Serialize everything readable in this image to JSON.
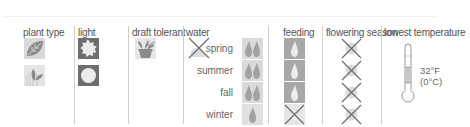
{
  "headers": {
    "plant_type": "plant type",
    "light": "light",
    "draft_tolerant": "draft tolerant",
    "water": "water",
    "feeding": "feeding",
    "flowering_season": "flowering season",
    "lowest_temperature": "lowest temperature"
  },
  "plant_type": {
    "icons": [
      "leaf-icon",
      "foliage-sprout-icon"
    ]
  },
  "light": {
    "icons": [
      "bright-sun-icon",
      "medium-sun-icon"
    ]
  },
  "draft_tolerant": {
    "icons": [
      "potted-plant-icon"
    ]
  },
  "water": {
    "header_icon": "crossed-out-mist-icon",
    "seasons": [
      {
        "label": "spring",
        "drops": 2
      },
      {
        "label": "summer",
        "drops": 2
      },
      {
        "label": "fall",
        "drops": 2
      },
      {
        "label": "winter",
        "drops": 1
      }
    ]
  },
  "feeding": {
    "seasons": [
      {
        "season": "spring",
        "value": "drop-icon"
      },
      {
        "season": "summer",
        "value": "drop-icon"
      },
      {
        "season": "fall",
        "value": "drop-icon"
      },
      {
        "season": "winter",
        "value": "none-x-icon"
      }
    ]
  },
  "flowering_season": {
    "seasons": [
      {
        "season": "spring",
        "value": "none-x-icon"
      },
      {
        "season": "summer",
        "value": "none-x-icon"
      },
      {
        "season": "fall",
        "value": "none-x-icon"
      },
      {
        "season": "winter",
        "value": "none-x-icon"
      }
    ]
  },
  "lowest_temperature": {
    "fahrenheit": "32°F",
    "celsius": "(0°C)"
  },
  "colors": {
    "icon_bg": "#d9d9d9",
    "icon_dark": "#6e6e6e",
    "drop": "#9a9a9a",
    "divider": "#cfcfcf"
  }
}
